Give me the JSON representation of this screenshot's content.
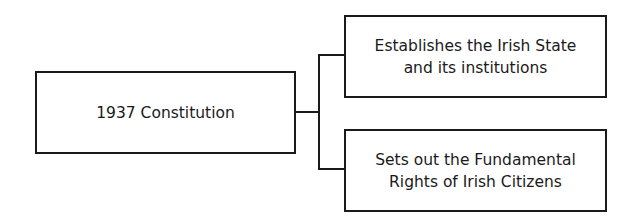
{
  "diagram": {
    "root": {
      "label": "1937 Constitution"
    },
    "children": [
      {
        "lines": [
          "Establishes the Irish State",
          "and its institutions"
        ]
      },
      {
        "lines": [
          "Sets out the Fundamental",
          "Rights of Irish Citizens"
        ]
      }
    ],
    "colors": {
      "stroke": "#1a1a1a",
      "background": "#ffffff"
    }
  }
}
